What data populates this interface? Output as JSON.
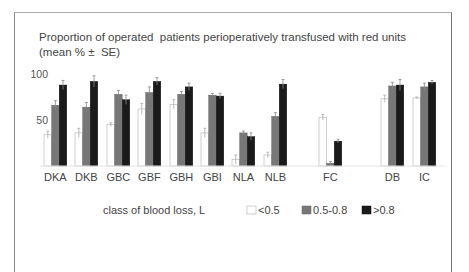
{
  "chart_data": {
    "type": "bar",
    "title": "Proportion of operated  patients perioperatively transfused with red units",
    "subtitle": "(mean % ±  SE)",
    "xlabel": "",
    "ylabel": "",
    "ylim": [
      0,
      100
    ],
    "yticks": [
      50,
      100
    ],
    "grid": false,
    "categories": [
      "DKA",
      "DKB",
      "GBC",
      "GBF",
      "GBH",
      "GBI",
      "NLA",
      "NLB",
      "FC",
      "DB",
      "IC"
    ],
    "series": [
      {
        "name": "<0.5",
        "color": "#ffffff",
        "values": [
          34,
          36,
          45,
          62,
          67,
          36,
          7,
          12,
          53,
          73,
          74
        ],
        "errors": [
          4,
          5,
          2,
          6,
          5,
          5,
          5,
          3,
          3,
          4,
          1
        ]
      },
      {
        "name": "0.5-0.8",
        "color": "#777777",
        "values": [
          66,
          64,
          78,
          80,
          78,
          77,
          36,
          54,
          3,
          87,
          86
        ],
        "errors": [
          5,
          5,
          4,
          6,
          3,
          2,
          2,
          4,
          2,
          4,
          4
        ]
      },
      {
        "name": ">0.8",
        "color": "#1a1a1a",
        "values": [
          88,
          92,
          72,
          92,
          86,
          76,
          32,
          89,
          27,
          88,
          91
        ],
        "errors": [
          5,
          6,
          5,
          4,
          4,
          3,
          4,
          5,
          2,
          6,
          2
        ]
      }
    ],
    "legend": {
      "title": "class of blood loss, L",
      "placement": "bottom",
      "entries": [
        "<0.5",
        "0.5-0.8",
        ">0.8"
      ]
    }
  }
}
